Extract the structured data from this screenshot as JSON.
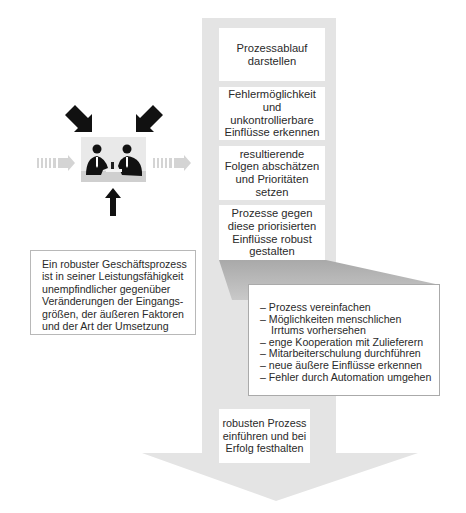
{
  "process_steps": [
    {
      "label": "Prozessablauf\ndarstellen"
    },
    {
      "label": "Fehlermöglichkeit\nund\nunkontrollierbare\nEinflüsse erkennen"
    },
    {
      "label": "resultierende\nFolgen abschätzen\nund Prioritäten\nsetzen"
    },
    {
      "label": "Prozesse gegen\ndiese priorisierten\nEinflüsse robust\ngestalten"
    },
    {
      "label": "robusten Prozess\neinführen und bei\nErfolg festhalten"
    }
  ],
  "measures": {
    "items": [
      {
        "line1": "– Prozess vereinfachen"
      },
      {
        "line1": "– Möglichkeiten menschlichen",
        "line2": "Irrtums vorhersehen"
      },
      {
        "line1": "– enge Kooperation mit Zulieferern"
      },
      {
        "line1": "– Mitarbeiterschulung durchführen"
      },
      {
        "line1": "– neue äußere Einflüsse erkennen"
      },
      {
        "line1": "– Fehler durch Automation umgehen"
      }
    ]
  },
  "definition": {
    "lines": [
      "Ein robuster Geschäftsprozess",
      "ist in seiner Leistungsfähigkeit",
      "unempfindlicher gegenüber",
      "Veränderungen der Eingangs-",
      "größen, der äußeren Faktoren",
      "und der Art der Umsetzung"
    ]
  },
  "illustration": {
    "icon": "business-meeting-icon",
    "input_arrows": [
      "arrow-down-right-icon",
      "arrow-down-left-icon",
      "arrow-up-icon"
    ],
    "flow_arrows": [
      "dashed-arrow-right-icon",
      "dashed-arrow-right-icon"
    ]
  },
  "colors": {
    "arrow_fill": "#e3e3e3",
    "shadow_fill": "#b9b9b9",
    "box_fill": "#ffffff",
    "black_arrow": "#111111",
    "flow_arrow": "#d6d6d6"
  }
}
